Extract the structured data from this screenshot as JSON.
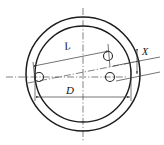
{
  "figure": {
    "kind": "engineering-drawing",
    "background_color": "#ffffff",
    "line_color": "#1c1c1c",
    "centerline_color": "#4a4a4a",
    "dimension_color": "#3a3a3a"
  },
  "labels": {
    "length": "L",
    "diameter": "D",
    "offset": "X"
  },
  "geometry": {
    "center": {
      "x": 83,
      "y": 74
    },
    "outer_circle_radius": 57,
    "inner_circle_radius": 48,
    "hole_radius": 4.5,
    "tilt_angle_deg": -11,
    "holes": [
      {
        "name": "hole-left",
        "x": 39,
        "y": 77
      },
      {
        "name": "hole-right-axis",
        "x": 110,
        "y": 77
      },
      {
        "name": "hole-right-tilted",
        "x": 108,
        "y": 56
      }
    ]
  },
  "dimensions": {
    "L": {
      "label": "L",
      "orientation": "tilted",
      "measures": "hole-center-distance-along-tilted-axis"
    },
    "D": {
      "label": "D",
      "orientation": "horizontal",
      "measures": "inner-bore-diameter"
    },
    "X": {
      "label": "X",
      "orientation": "vertical",
      "measures": "offset-between-parallel-tilted-lines"
    }
  }
}
